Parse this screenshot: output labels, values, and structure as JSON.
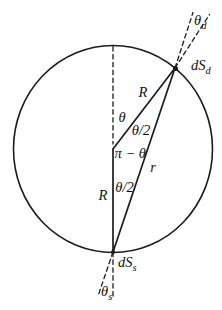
{
  "figure": {
    "colors": {
      "line": "#1c1c1c",
      "text": "#111111",
      "background": "#ffffff"
    },
    "labels": {
      "theta_detector": {
        "base": "θ",
        "sub": "d"
      },
      "dS_detector": {
        "base": "dS",
        "sub": "d"
      },
      "radius_upper": "R",
      "theta": "θ",
      "theta_half_upper": "θ/2",
      "pi_minus_theta": "π − θ",
      "chord_r": "r",
      "theta_half_lower": "θ/2",
      "radius_lower": "R",
      "dS_source": {
        "base": "dS",
        "sub": "s"
      },
      "theta_source": {
        "base": "θ",
        "sub": "s"
      }
    }
  }
}
